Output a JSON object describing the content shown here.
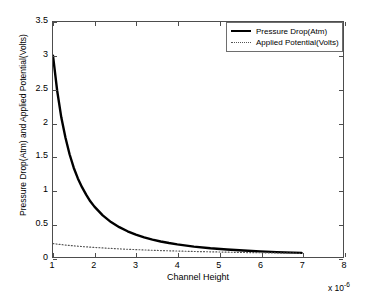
{
  "chart_data": {
    "type": "line",
    "title": "",
    "xlabel": "Channel Height",
    "ylabel": "Pressure Drop(Atm) and Applied Potential(Volts)",
    "x_multiplier": "x 10",
    "x_multiplier_exponent": "-6",
    "xlim": [
      1,
      8
    ],
    "ylim": [
      0,
      3.5
    ],
    "xticks": [
      "1",
      "2",
      "3",
      "4",
      "5",
      "6",
      "7",
      "8"
    ],
    "yticks": [
      "0",
      "0.5",
      "1",
      "1.5",
      "2",
      "2.5",
      "3",
      "3.5"
    ],
    "grid": false,
    "legend_position": "top-right",
    "x": [
      1.0,
      1.1,
      1.2,
      1.3,
      1.4,
      1.5,
      1.6,
      1.7,
      1.8,
      1.9,
      2.0,
      2.2,
      2.4,
      2.6,
      2.8,
      3.0,
      3.2,
      3.4,
      3.6,
      3.8,
      4.0,
      4.4,
      4.8,
      5.2,
      5.6,
      6.0,
      6.4,
      6.8,
      7.0
    ],
    "series": [
      {
        "name": "Pressure Drop(Atm)",
        "style": "solid",
        "color": "#000000",
        "width": 2.4,
        "values": [
          3.0,
          2.48,
          2.08,
          1.78,
          1.53,
          1.33,
          1.17,
          1.04,
          0.93,
          0.83,
          0.75,
          0.62,
          0.52,
          0.444,
          0.383,
          0.333,
          0.293,
          0.26,
          0.231,
          0.208,
          0.188,
          0.155,
          0.13,
          0.111,
          0.096,
          0.083,
          0.073,
          0.065,
          0.061
        ]
      },
      {
        "name": "Applied Potential(Volts)",
        "style": "dotted",
        "color": "#555555",
        "width": 1.2,
        "values": [
          0.2,
          0.192,
          0.185,
          0.178,
          0.172,
          0.166,
          0.161,
          0.156,
          0.151,
          0.147,
          0.143,
          0.135,
          0.128,
          0.121,
          0.115,
          0.11,
          0.105,
          0.1,
          0.096,
          0.092,
          0.089,
          0.082,
          0.077,
          0.072,
          0.067,
          0.063,
          0.06,
          0.057,
          0.055
        ]
      }
    ]
  },
  "legend": {
    "entries": [
      {
        "label": "Pressure Drop(Atm)"
      },
      {
        "label": "Applied Potential(Volts)"
      }
    ]
  }
}
